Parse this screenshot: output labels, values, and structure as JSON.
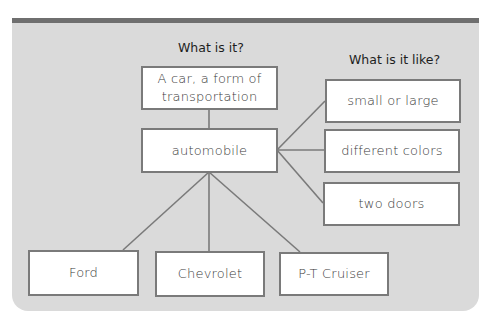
{
  "diagram": {
    "heading_what": "What is it?",
    "heading_like": "What is it like?",
    "definition": "A car, a form of transportation",
    "definition_line1": "A car, a form of",
    "definition_line2": "transportation",
    "center": "automobile",
    "properties": [
      "small or large",
      "different colors",
      "two doors"
    ],
    "examples": [
      "Ford",
      "Chevrolet",
      "P-T Cruiser"
    ]
  },
  "colors": {
    "panel": "#dadada",
    "top_bar": "#6f6f6f",
    "box_border": "#7a7a7a"
  }
}
